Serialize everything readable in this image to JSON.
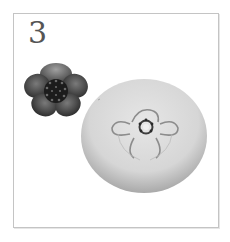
{
  "step": {
    "number": "3"
  },
  "illustration": {
    "flower": {
      "name": "five-petal-flower",
      "petal_color": "#4a4a4a",
      "center_color": "#1c1c1c"
    },
    "mold": {
      "name": "round-silicone-mold-with-flower-impression",
      "body_color": "#d9d9d9",
      "shadow_color": "#a8a8a8"
    }
  },
  "frame": {
    "border_color": "#c4c4c4"
  }
}
